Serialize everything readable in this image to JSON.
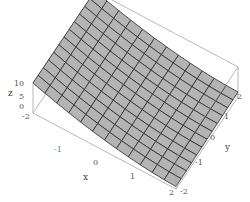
{
  "chart_data": {
    "type": "surface3d",
    "title": "",
    "xlabel": "x",
    "ylabel": "y",
    "zlabel": "z",
    "xlim": [
      -2,
      2
    ],
    "ylim": [
      -2,
      2
    ],
    "zlim": [
      -2,
      10
    ],
    "x_ticks": [
      "-1",
      "0",
      "1",
      "2"
    ],
    "y_ticks": [
      "-2",
      "-1",
      "0",
      "1",
      "2"
    ],
    "z_ticks": [
      "-2",
      "0",
      "5",
      "10"
    ],
    "mesh": 12,
    "corner_heights": {
      "x=-2,y=-2": 10,
      "x=-2,y=2": 10,
      "x=2,y=2": 0,
      "x=2,y=-2": -1
    },
    "surface_color": "#b4b4b4",
    "mesh_color": "#2a2a2a",
    "box_color": "#9a9a9a"
  },
  "labels": {
    "z_axis": "z",
    "z10": "10",
    "z5": "5",
    "z0": "0",
    "zm2": "-2",
    "xm1": "-1",
    "x0": "0",
    "x1": "1",
    "x2": "2",
    "x_axis": "x",
    "ym2": "-2",
    "ym1": "-1",
    "y0": "0",
    "y1": "1",
    "y2": "2",
    "y_axis": "y"
  }
}
